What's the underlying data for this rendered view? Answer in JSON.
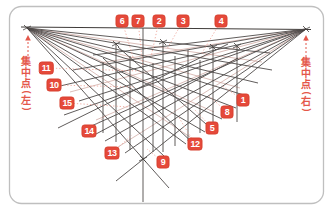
{
  "colors": {
    "accent_red": "#e5493a",
    "badge_border": "#d8402f",
    "line_dark": "#4e4a48",
    "line_light": "#c2928a",
    "leader_pink": "#ee9d91",
    "card_border": "#bfbfbf"
  },
  "vp_left": {
    "text": "集中点(左)",
    "chars": [
      "集",
      "中",
      "点",
      "(",
      "左",
      ")"
    ],
    "pos": {
      "x": 19,
      "y": 56
    }
  },
  "vp_right": {
    "text": "集中点(右)",
    "chars": [
      "集",
      "中",
      "点",
      "(",
      "右",
      ")"
    ],
    "pos": {
      "x": 299,
      "y": 57
    }
  },
  "labels": [
    {
      "n": "1",
      "cx": 243,
      "cy": 100,
      "tx": 221,
      "ty": 85
    },
    {
      "n": "2",
      "cx": 159,
      "cy": 21,
      "tx": 151,
      "ty": 57
    },
    {
      "n": "3",
      "cx": 183,
      "cy": 21,
      "tx": 167,
      "ty": 49
    },
    {
      "n": "4",
      "cx": 221,
      "cy": 21,
      "tx": 202,
      "ty": 53
    },
    {
      "n": "5",
      "cx": 212,
      "cy": 128,
      "tx": 194,
      "ty": 109
    },
    {
      "n": "6",
      "cx": 122,
      "cy": 21,
      "tx": 133,
      "ty": 57
    },
    {
      "n": "7",
      "cx": 138,
      "cy": 21,
      "tx": 143,
      "ty": 66
    },
    {
      "n": "8",
      "cx": 227,
      "cy": 112,
      "tx": 208,
      "ty": 95
    },
    {
      "n": "9",
      "cx": 163,
      "cy": 162,
      "tx": 147,
      "ty": 149
    },
    {
      "n": "10",
      "cx": 54,
      "cy": 85,
      "tx": 134,
      "ty": 87
    },
    {
      "n": "11",
      "cx": 46,
      "cy": 68,
      "tx": 141,
      "ty": 71
    },
    {
      "n": "12",
      "cx": 195,
      "cy": 144,
      "tx": 178,
      "ty": 116
    },
    {
      "n": "13",
      "cx": 112,
      "cy": 153,
      "tx": 132,
      "ty": 135
    },
    {
      "n": "14",
      "cx": 89,
      "cy": 131,
      "tx": 105,
      "ty": 116
    },
    {
      "n": "15",
      "cx": 67,
      "cy": 103,
      "tx": 129,
      "ty": 107
    }
  ],
  "diagram": {
    "vp_left_point": {
      "x": 27,
      "y": 28
    },
    "vp_right_point": {
      "x": 306,
      "y": 29
    },
    "bottom_vertex": {
      "x": 143,
      "y": 159
    },
    "horizon": [
      21,
      27,
      311,
      29.5
    ],
    "fan_left": [
      [
        270,
        53
      ],
      [
        272,
        70
      ],
      [
        258,
        83
      ],
      [
        247,
        96
      ],
      [
        236,
        108
      ],
      [
        222,
        119
      ],
      [
        205,
        132
      ],
      [
        186,
        144
      ],
      [
        164,
        156
      ],
      [
        169,
        188
      ]
    ],
    "fan_right": [
      [
        93,
        55
      ],
      [
        73,
        70
      ],
      [
        60,
        86
      ],
      [
        79,
        101
      ],
      [
        64,
        115
      ],
      [
        87,
        128
      ],
      [
        105,
        141
      ],
      [
        125,
        153
      ],
      [
        116,
        181
      ]
    ],
    "fan_left_light": [
      [
        262,
        62
      ],
      [
        240,
        88
      ],
      [
        214,
        112
      ],
      [
        190,
        137
      ]
    ],
    "fan_right_light": [
      [
        100,
        63
      ],
      [
        70,
        92
      ],
      [
        96,
        120
      ],
      [
        118,
        147
      ]
    ],
    "verticals": [
      [
        103,
        62,
        133
      ],
      [
        116,
        44,
        142
      ],
      [
        130,
        56,
        150
      ],
      [
        143,
        28,
        202
      ],
      [
        153,
        63,
        152
      ],
      [
        163,
        42,
        152
      ],
      [
        175,
        56,
        146
      ],
      [
        188,
        50,
        141
      ],
      [
        200,
        60,
        133
      ],
      [
        213,
        47,
        130
      ],
      [
        237,
        46,
        122
      ]
    ],
    "diagonals": [
      [
        58,
        128,
        228,
        44
      ],
      [
        96,
        134,
        238,
        58
      ],
      [
        103,
        58,
        197,
        147
      ],
      [
        118,
        47,
        214,
        131
      ]
    ],
    "ticks": [
      [
        27,
        28
      ],
      [
        306,
        29
      ],
      [
        143,
        159
      ],
      [
        116,
        44
      ],
      [
        163,
        42
      ],
      [
        213,
        47
      ],
      [
        237,
        46
      ]
    ],
    "arrows": {
      "left": {
        "x": 28,
        "y1": 56,
        "y2": 39
      },
      "right": {
        "x": 306,
        "y1": 57,
        "y2": 39
      }
    }
  }
}
